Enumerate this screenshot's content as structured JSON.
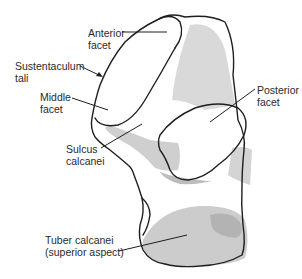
{
  "figure": {
    "colors": {
      "outline": "#1e1e1e",
      "shade_light": "#dcdcdc",
      "shade_mid": "#c8c8c8",
      "shade_dark": "#b4b4b4",
      "background": "#ffffff",
      "text": "#2a2a2a"
    }
  },
  "labels": [
    {
      "id": "anterior-facet",
      "lines": [
        "Anterior",
        "facet"
      ]
    },
    {
      "id": "sustentaculum-tali",
      "lines": [
        "Sustentaculum",
        "tali"
      ]
    },
    {
      "id": "middle-facet",
      "lines": [
        "Middle",
        "facet"
      ]
    },
    {
      "id": "posterior-facet",
      "lines": [
        "Posterior",
        "facet"
      ]
    },
    {
      "id": "sulcus-calcanei",
      "lines": [
        "Sulcus",
        "calcanei"
      ]
    },
    {
      "id": "tuber-calcanei",
      "lines": [
        "Tuber calcanei",
        "(superior aspect)"
      ]
    }
  ]
}
